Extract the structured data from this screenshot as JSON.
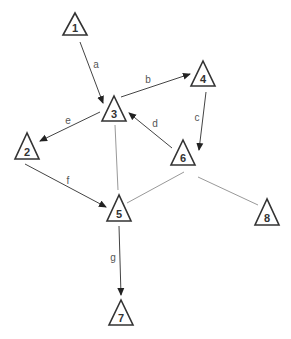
{
  "diagram": {
    "type": "directed-graph",
    "nodes": [
      {
        "id": "1",
        "label": "1",
        "apex": [
          75,
          13
        ]
      },
      {
        "id": "2",
        "label": "2",
        "apex": [
          27,
          133
        ]
      },
      {
        "id": "3",
        "label": "3",
        "apex": [
          114,
          96
        ]
      },
      {
        "id": "4",
        "label": "4",
        "apex": [
          203,
          61
        ]
      },
      {
        "id": "5",
        "label": "5",
        "apex": [
          119,
          195
        ]
      },
      {
        "id": "6",
        "label": "6",
        "apex": [
          183,
          140
        ]
      },
      {
        "id": "7",
        "label": "7",
        "apex": [
          121,
          300
        ]
      },
      {
        "id": "8",
        "label": "8",
        "apex": [
          267,
          199
        ]
      }
    ],
    "edges": [
      {
        "from": "1",
        "to": "3",
        "label": "a",
        "directed": true
      },
      {
        "from": "3",
        "to": "4",
        "label": "b",
        "directed": true
      },
      {
        "from": "4",
        "to": "6",
        "label": "c",
        "directed": true
      },
      {
        "from": "6",
        "to": "3",
        "label": "d",
        "directed": true
      },
      {
        "from": "3",
        "to": "2",
        "label": "e",
        "directed": true
      },
      {
        "from": "2",
        "to": "5",
        "label": "f",
        "directed": true
      },
      {
        "from": "5",
        "to": "7",
        "label": "g",
        "directed": true
      },
      {
        "from": "3",
        "to": "5",
        "label": "",
        "directed": false
      },
      {
        "from": "5",
        "to": "6",
        "label": "",
        "directed": false
      },
      {
        "from": "6",
        "to": "8",
        "label": "",
        "directed": false
      }
    ],
    "colors": {
      "node_stroke": "#333333",
      "directed_edge": "#444444",
      "undirected_edge": "#999999",
      "background": "#ffffff"
    }
  }
}
